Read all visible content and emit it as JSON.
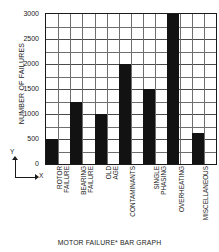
{
  "chart_data": {
    "type": "bar",
    "title": "MOTOR FAILURE* BAR GRAPH",
    "xlabel": "X",
    "ylabel": "NUMBER OF FAILURES",
    "ylim": [
      0,
      3000
    ],
    "grid": true,
    "legend": "none",
    "categories": [
      "ROTOR\nFAILURE",
      "BEARING\nFAILURE",
      "OLD\nAGE",
      "CONTAMINANTS",
      "SINGLE\nPHASING",
      "OVERHEATING",
      "MISCELLANEOUS"
    ],
    "values": [
      500,
      1250,
      1000,
      2000,
      1500,
      3000,
      625
    ],
    "ytick_labels": [
      "0",
      "500",
      "1000",
      "1500",
      "2000",
      "2500",
      "3000"
    ],
    "ytick_values": [
      0,
      500,
      1000,
      1500,
      2000,
      2500,
      3000
    ],
    "minor_tick_step": 250,
    "bar_color": "#121212",
    "grid_color": "#6e6e6e",
    "axis_color": "#1a1a1a",
    "background": "#ffffff"
  },
  "axis_key": {
    "y_label": "Y",
    "x_label": "X"
  },
  "caption": {
    "text": "MOTOR FAILURE* BAR GRAPH"
  }
}
